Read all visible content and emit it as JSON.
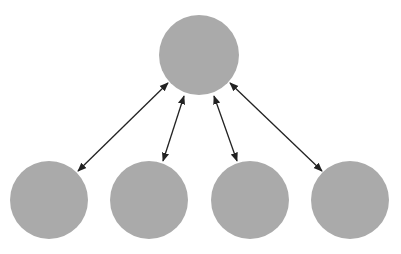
{
  "diagram": {
    "type": "hub-and-spoke",
    "colors": {
      "node_fill": "#aaaaaa",
      "edge": "#222222",
      "background": "#ffffff"
    },
    "nodes": [
      {
        "id": "hub",
        "cx": 199,
        "cy": 55,
        "r": 40
      },
      {
        "id": "leaf-1",
        "cx": 49,
        "cy": 200,
        "r": 39
      },
      {
        "id": "leaf-2",
        "cx": 149,
        "cy": 200,
        "r": 39
      },
      {
        "id": "leaf-3",
        "cx": 250,
        "cy": 200,
        "r": 39
      },
      {
        "id": "leaf-4",
        "cx": 350,
        "cy": 200,
        "r": 39
      }
    ],
    "edges": [
      {
        "from": "hub",
        "to": "leaf-1",
        "x1": 168,
        "y1": 83,
        "x2": 78,
        "y2": 171,
        "bidirectional": true
      },
      {
        "from": "hub",
        "to": "leaf-2",
        "x1": 184,
        "y1": 96,
        "x2": 163,
        "y2": 161,
        "bidirectional": true
      },
      {
        "from": "hub",
        "to": "leaf-3",
        "x1": 214,
        "y1": 96,
        "x2": 237,
        "y2": 161,
        "bidirectional": true
      },
      {
        "from": "hub",
        "to": "leaf-4",
        "x1": 230,
        "y1": 83,
        "x2": 322,
        "y2": 171,
        "bidirectional": true
      }
    ]
  }
}
